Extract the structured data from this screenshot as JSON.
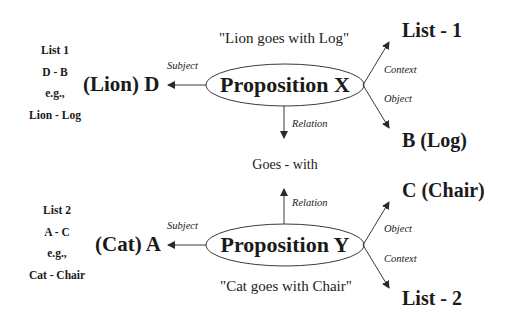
{
  "diagram": {
    "type": "proposition-network",
    "propositions": [
      {
        "id": "X",
        "label": "Proposition X",
        "quote": "\"Lion goes with Log\"",
        "subject": {
          "edge_label": "Subject",
          "node": "(Lion) D"
        },
        "relation": {
          "edge_label": "Relation",
          "direction": "down"
        },
        "context": {
          "edge_label": "Context",
          "node": "List - 1"
        },
        "object": {
          "edge_label": "Object",
          "node": "B (Log)"
        },
        "list_info": {
          "lines": [
            "List 1",
            "D - B",
            "e.g.,",
            "Lion - Log"
          ]
        }
      },
      {
        "id": "Y",
        "label": "Proposition Y",
        "quote": "\"Cat goes with Chair\"",
        "subject": {
          "edge_label": "Subject",
          "node": "(Cat) A"
        },
        "relation": {
          "edge_label": "Relation",
          "direction": "up"
        },
        "object": {
          "edge_label": "Object",
          "node": "C (Chair)"
        },
        "context": {
          "edge_label": "Context",
          "node": "List - 2"
        },
        "list_info": {
          "lines": [
            "List 2",
            "A - C",
            "e.g.,",
            "Cat - Chair"
          ]
        }
      }
    ],
    "shared_relation": "Goes - with",
    "colors": {
      "stroke": "#3a3a3a",
      "text": "#1a1a1a",
      "background": "#ffffff"
    }
  }
}
